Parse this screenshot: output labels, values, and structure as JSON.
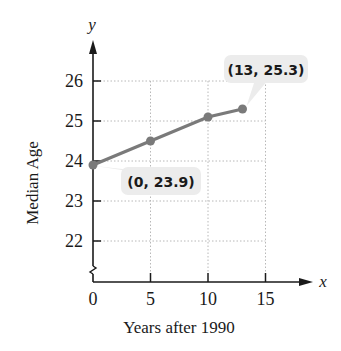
{
  "top_text": "g... ... ... ... ... ... g...",
  "chart_data": {
    "type": "line",
    "title": "",
    "xlabel": "Years after 1990",
    "ylabel": "Median Age",
    "x_axis_symbol": "x",
    "y_axis_symbol": "y",
    "x_ticks": [
      0,
      5,
      10,
      15
    ],
    "y_ticks": [
      22,
      23,
      24,
      25,
      26
    ],
    "xlim": [
      0,
      19
    ],
    "ylim": [
      21,
      26.8
    ],
    "y_axis_break": true,
    "grid": true,
    "series": [
      {
        "name": "Median Age",
        "x": [
          0,
          5,
          10,
          13
        ],
        "y": [
          23.9,
          24.5,
          25.1,
          25.3
        ],
        "color": "#7a7a7a"
      }
    ],
    "annotations": [
      {
        "label": "(0, 23.9)",
        "x": 0,
        "y": 23.9
      },
      {
        "label": "(13, 25.3)",
        "x": 13,
        "y": 25.3
      }
    ]
  },
  "colors": {
    "axis": "#1a1a1a",
    "grid": "#b8b8b8",
    "line": "#7a7a7a",
    "callout_bg": "#ececec"
  }
}
